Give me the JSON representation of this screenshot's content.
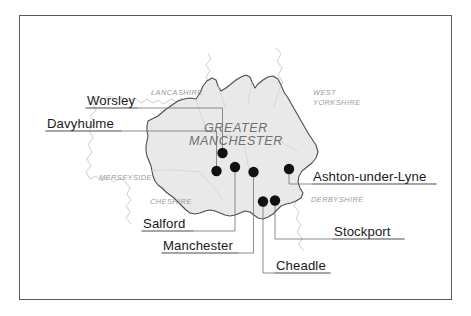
{
  "figure": {
    "frame_color": "#5a5a5a",
    "background": "#ffffff"
  },
  "map": {
    "region_label": {
      "line1": "GREATER",
      "line2": "MANCHESTER",
      "color": "#707070"
    },
    "region_fill": "#e9e9e9",
    "region_stroke": "#4d4d4d",
    "neighbour_stroke": "#bdbdbd",
    "surrounding_counties": [
      {
        "name": "LANCASHIRE",
        "lines": [
          "LANCASHIRE"
        ]
      },
      {
        "name": "WEST YORKSHIRE",
        "lines": [
          "WEST",
          "YORKSHIRE"
        ]
      },
      {
        "name": "MERSEYSIDE",
        "lines": [
          "MERSEYSIDE"
        ]
      },
      {
        "name": "CHESHIRE",
        "lines": [
          "CHESHIRE"
        ]
      },
      {
        "name": "DERBYSHIRE",
        "lines": [
          "DERBYSHIRE"
        ]
      }
    ],
    "marker_color": "#111111",
    "leader_color": "#6e6e6e",
    "places": [
      {
        "label": "Worsley",
        "side": "left"
      },
      {
        "label": "Davyhulme",
        "side": "left"
      },
      {
        "label": "Salford",
        "side": "left"
      },
      {
        "label": "Manchester",
        "side": "left"
      },
      {
        "label": "Ashton-under-Lyne",
        "side": "right"
      },
      {
        "label": "Stockport",
        "side": "right"
      },
      {
        "label": "Cheadle",
        "side": "right"
      }
    ]
  }
}
